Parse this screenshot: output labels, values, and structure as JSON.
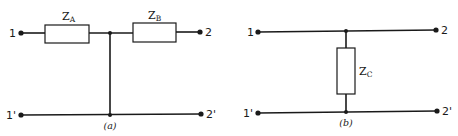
{
  "diagrams": [
    {
      "id": "a",
      "caption": "(a)",
      "topology": "T-network (series-shunt)",
      "terminals": {
        "in_top": "1",
        "out_top": "2",
        "in_bottom": "1'",
        "out_bottom": "2'"
      },
      "impedances": [
        {
          "symbol": "Z",
          "subscript": "A",
          "position": "series, left of junction"
        },
        {
          "symbol": "Z",
          "subscript": "B",
          "position": "series, right of junction"
        }
      ]
    },
    {
      "id": "b",
      "caption": "(b)",
      "topology": "shunt element",
      "terminals": {
        "in_top": "1",
        "out_top": "2",
        "in_bottom": "1'",
        "out_bottom": "2'"
      },
      "impedances": [
        {
          "symbol": "Z",
          "subscript": "C",
          "position": "shunt between top and bottom rails"
        }
      ]
    }
  ]
}
